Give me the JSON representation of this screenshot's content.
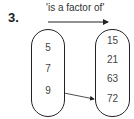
{
  "question": {
    "number": "3."
  },
  "relation": {
    "label": "'is a factor of'"
  },
  "diagram": {
    "left_set": {
      "items": [
        "5",
        "7",
        "9"
      ]
    },
    "right_set": {
      "items": [
        "15",
        "21",
        "63",
        "72"
      ]
    },
    "mappings": [
      {
        "from": "9",
        "to": "72"
      }
    ]
  }
}
